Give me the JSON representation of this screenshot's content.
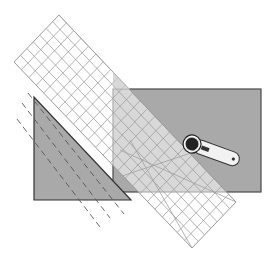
{
  "figure": {
    "colors": {
      "background": "#ffffff",
      "fabric": "#a9a9a9",
      "fabric_edge": "#4a4a4a",
      "ruler_grid": "#9a9a9a",
      "ruler_overlap": "#c8c8c8",
      "cut_lines": "#555555",
      "cutter_handle": "#f2f2f2",
      "cutter_wheel": "#222222"
    },
    "fabric_rect": {
      "x": 113,
      "y": 89,
      "w": 148,
      "h": 103
    },
    "triangle": {
      "points": "34,97 34,200 131,200"
    },
    "ruler": {
      "top": [
        59,
        15
      ],
      "left": [
        14,
        62
      ],
      "bottom": [
        192,
        248
      ],
      "right": [
        236,
        202
      ],
      "grid_cols": 7,
      "grid_rows": 24
    },
    "rotary_cutter": {
      "x": 192,
      "y": 144
    }
  }
}
